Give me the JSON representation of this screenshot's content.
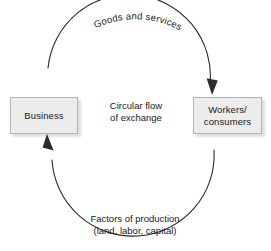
{
  "diagram": {
    "title": "Circular flow of exchange",
    "canvas": {
      "width": 271,
      "height": 251,
      "background": "#ffffff"
    },
    "center_label": "Circular flow\nof exchange",
    "nodes": [
      {
        "id": "business",
        "label": "Business",
        "fill": "#ececec",
        "border": "#b4b4b4"
      },
      {
        "id": "workers",
        "label": "Workers/\nconsumers",
        "fill": "#ececec",
        "border": "#b4b4b4"
      }
    ],
    "flows": [
      {
        "id": "goods-and-services",
        "label": "Goods and services",
        "from": "business",
        "to": "workers",
        "direction": "clockwise",
        "position": "top-arc",
        "curved_text": true
      },
      {
        "id": "factors-of-production",
        "label": "Factors of production\n(land, labor, capital)",
        "from": "workers",
        "to": "business",
        "direction": "counter-clockwise",
        "position": "bottom",
        "curved_text": false
      }
    ],
    "circle": {
      "cx": 136,
      "cy": 116,
      "r": 78,
      "stroke": "#2b2b2b",
      "stroke_width": 1
    },
    "arrow_color": "#2b2b2b"
  }
}
